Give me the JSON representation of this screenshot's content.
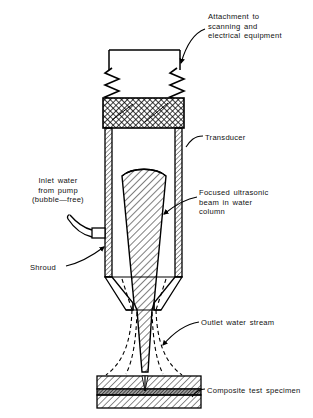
{
  "figure": {
    "type": "technical-diagram",
    "background_color": "#ffffff",
    "line_color": "#000000"
  },
  "labels": {
    "attachment": "Attachment to\nscanning and\nelectrical equipment",
    "transducer": "Transducer",
    "beam": "Focused ultrasonic\nbeam in water\ncolumn",
    "inlet": "Inlet water\nfrom pump\n(bubble—free)",
    "shroud": "Shroud",
    "outlet": "Outlet water stream",
    "specimen": "Composite test specimen"
  },
  "parts": {
    "mounting_bracket": "mounting-bracket",
    "springs": "suspension-springs",
    "transducer_block": "transducer-housing",
    "shroud_body": "shroud-body",
    "inlet_port": "inlet-water-port",
    "beam_cone": "focused-beam-cone",
    "nozzle": "outlet-nozzle",
    "water_stream": "outlet-water-stream",
    "specimen_top_ply": "specimen-top-ply",
    "specimen_core": "specimen-core-layer",
    "specimen_bottom_ply": "specimen-bottom-ply"
  },
  "colors": {
    "ink": "#000000",
    "crosshatch_fill": "#8f8f8f",
    "core_fill": "#8a8a8a",
    "white": "#ffffff"
  }
}
